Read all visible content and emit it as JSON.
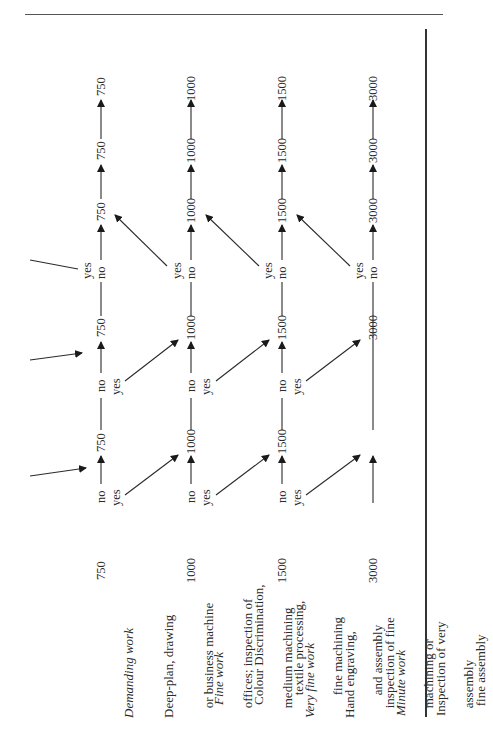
{
  "rows": [
    {
      "level": "750",
      "title": "Demanding work",
      "description_lines": [
        "Deep-plan, drawing",
        "   or business machine",
        "   offices; inspection of",
        "   medium machining"
      ],
      "chain": [
        "750",
        "750",
        "750",
        "750",
        "750"
      ]
    },
    {
      "level": "1000",
      "title": "Fine work",
      "description_lines": [
        "Colour Discrimination,",
        "   textile processing,",
        "   fine machining",
        "   and assembly"
      ],
      "chain": [
        "1000",
        "1000",
        "1000",
        "1000",
        "1000"
      ]
    },
    {
      "level": "1500",
      "title": "Very fine work",
      "description_lines": [
        "Hand engraving,",
        "   inspection of fine",
        "   machining or",
        "   assembly"
      ],
      "chain": [
        "1500",
        "1500",
        "1500",
        "1500",
        "1500"
      ]
    },
    {
      "level": "3000",
      "title": "Minute work",
      "description_lines": [
        "Inspection of very",
        "   fine assembly"
      ],
      "chain": [
        "3000",
        "3000",
        "3000",
        "3000",
        "3000"
      ]
    }
  ],
  "branch_labels": {
    "yes": "yes",
    "no": "no"
  },
  "colors": {
    "ink": "#2a2a2a",
    "rule": "#333333",
    "background": "#ffffff"
  }
}
